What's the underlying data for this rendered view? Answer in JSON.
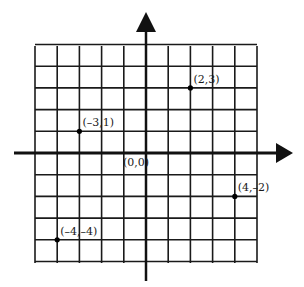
{
  "diagram": {
    "type": "coordinate-plane",
    "x_range": [
      -5,
      5
    ],
    "y_range": [
      -5,
      5
    ],
    "grid_step": 1,
    "origin_label": "(0,0)",
    "colors": {
      "grid": "#1a1a1a",
      "axis": "#111111",
      "background": "#ffffff"
    }
  },
  "chart_data": {
    "type": "scatter",
    "title": "",
    "xlabel": "",
    "ylabel": "",
    "xlim": [
      -5,
      5
    ],
    "ylim": [
      -5,
      5
    ],
    "grid": true,
    "points": [
      {
        "x": 2,
        "y": 3,
        "label": "(2,3)"
      },
      {
        "x": -3,
        "y": 1,
        "label": "(–3,1)"
      },
      {
        "x": 4,
        "y": -2,
        "label": "(4,–2)"
      },
      {
        "x": -4,
        "y": -4,
        "label": "(–4,–4)"
      }
    ],
    "annotations": [
      "(0,0)"
    ]
  }
}
